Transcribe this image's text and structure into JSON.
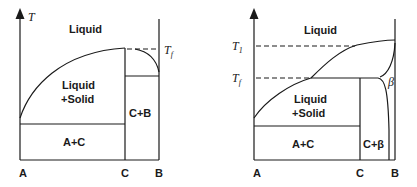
{
  "figure": {
    "left_diagram": {
      "axis_label": "T",
      "regions": {
        "liquid": "Liquid",
        "liquid_solid_line1": "Liquid",
        "liquid_solid_line2": "+Solid",
        "a_c": "A+C",
        "c_b": "C+B"
      },
      "temperature_marks": {
        "tf": "T",
        "tf_sub": "f"
      },
      "x_labels": {
        "a": "A",
        "c": "C",
        "b": "B"
      }
    },
    "right_diagram": {
      "regions": {
        "liquid": "Liquid",
        "liquid_solid_line1": "Liquid",
        "liquid_solid_line2": "+Solid",
        "a_c": "A+C",
        "c_beta": "C+β",
        "beta": "β"
      },
      "temperature_marks": {
        "t1": "T",
        "t1_sub": "1",
        "tf": "T",
        "tf_sub": "f"
      },
      "x_labels": {
        "a": "A",
        "c": "C",
        "b": "B"
      }
    }
  }
}
